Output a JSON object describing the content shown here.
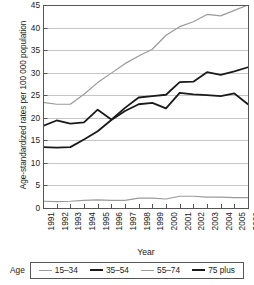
{
  "chart_data": {
    "type": "line",
    "title": "",
    "xlabel": "Year",
    "ylabel": "Age-standardized rates per 100 000 population",
    "legend_title": "Age",
    "legend_position": "bottom",
    "grid": true,
    "xlim": [
      1991,
      2006
    ],
    "ylim": [
      0,
      45
    ],
    "yticks": [
      0,
      5,
      10,
      15,
      20,
      25,
      30,
      35,
      40,
      45
    ],
    "categories": [
      "1991",
      "1992",
      "1993",
      "1994",
      "1995",
      "1996",
      "1997",
      "1998",
      "1999",
      "2000",
      "2001",
      "2002",
      "2003",
      "2004",
      "2005",
      "2006"
    ],
    "series": [
      {
        "name": "15–34",
        "color": "#9a9a9a",
        "values": [
          1.5,
          1.4,
          1.5,
          1.7,
          1.8,
          1.7,
          1.7,
          2.2,
          2.2,
          2.0,
          2.6,
          2.6,
          2.4,
          2.4,
          2.3,
          2.3
        ]
      },
      {
        "name": "35–54",
        "color": "#1a1a1a",
        "values": [
          13.5,
          13.4,
          13.5,
          15.2,
          17.0,
          19.5,
          21.5,
          23.0,
          23.3,
          22.1,
          25.5,
          25.2,
          25.0,
          24.8,
          25.4,
          23.0
        ]
      },
      {
        "name": "55–74",
        "color": "#9a9a9a",
        "values": [
          23.4,
          23.0,
          23.0,
          25.2,
          27.8,
          29.9,
          32.0,
          33.7,
          35.2,
          38.3,
          40.2,
          41.3,
          42.9,
          42.6,
          43.8,
          45.0
        ]
      },
      {
        "name": "75 plus",
        "color": "#1a1a1a",
        "values": [
          18.2,
          19.4,
          18.7,
          19.0,
          21.8,
          19.6,
          22.2,
          24.5,
          24.8,
          25.1,
          27.9,
          28.0,
          30.1,
          29.5,
          30.3,
          31.2
        ]
      }
    ]
  }
}
